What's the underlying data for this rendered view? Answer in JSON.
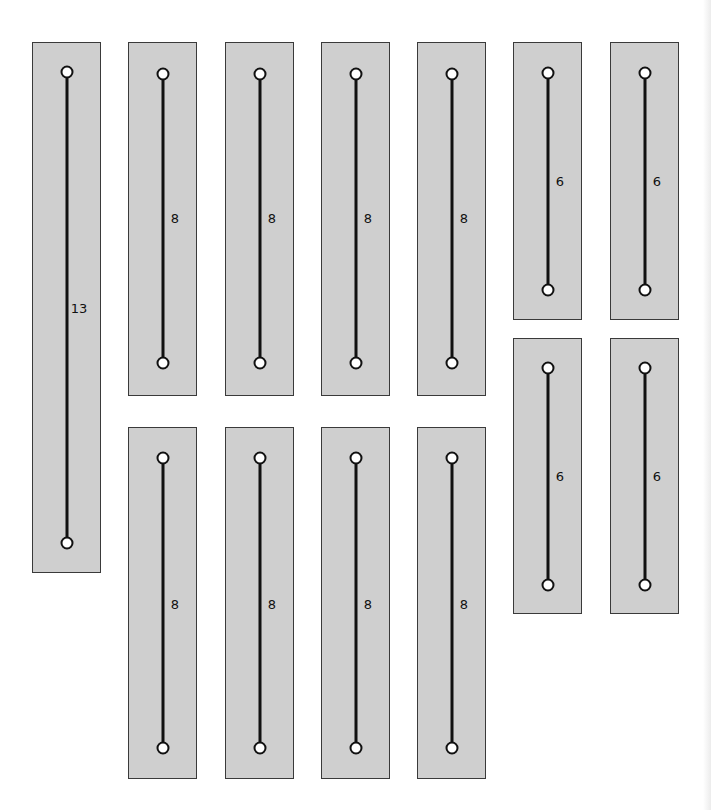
{
  "diagram": {
    "colors": {
      "panel_fill": "#cfcfcf",
      "panel_border": "#3a3a3a",
      "line": "#111111",
      "node_fill": "#ffffff"
    },
    "panels": [
      {
        "id": "p1",
        "length_label": "13",
        "box": [
          32,
          42,
          69,
          531
        ],
        "top_node_y": 72,
        "bottom_node_y": 543,
        "label_y": 308
      },
      {
        "id": "p2",
        "length_label": "8",
        "box": [
          128,
          42,
          69,
          354
        ],
        "top_node_y": 74,
        "bottom_node_y": 363,
        "label_y": 218
      },
      {
        "id": "p3",
        "length_label": "8",
        "box": [
          225,
          42,
          69,
          354
        ],
        "top_node_y": 74,
        "bottom_node_y": 363,
        "label_y": 218
      },
      {
        "id": "p4",
        "length_label": "8",
        "box": [
          321,
          42,
          69,
          354
        ],
        "top_node_y": 74,
        "bottom_node_y": 363,
        "label_y": 218
      },
      {
        "id": "p5",
        "length_label": "8",
        "box": [
          417,
          42,
          69,
          354
        ],
        "top_node_y": 74,
        "bottom_node_y": 363,
        "label_y": 218
      },
      {
        "id": "p6",
        "length_label": "6",
        "box": [
          513,
          42,
          69,
          278
        ],
        "top_node_y": 73,
        "bottom_node_y": 290,
        "label_y": 181
      },
      {
        "id": "p7",
        "length_label": "6",
        "box": [
          610,
          42,
          69,
          278
        ],
        "top_node_y": 73,
        "bottom_node_y": 290,
        "label_y": 181
      },
      {
        "id": "p8",
        "length_label": "8",
        "box": [
          128,
          427,
          69,
          352
        ],
        "top_node_y": 458,
        "bottom_node_y": 748,
        "label_y": 604
      },
      {
        "id": "p9",
        "length_label": "8",
        "box": [
          225,
          427,
          69,
          352
        ],
        "top_node_y": 458,
        "bottom_node_y": 748,
        "label_y": 604
      },
      {
        "id": "p10",
        "length_label": "8",
        "box": [
          321,
          427,
          69,
          352
        ],
        "top_node_y": 458,
        "bottom_node_y": 748,
        "label_y": 604
      },
      {
        "id": "p11",
        "length_label": "8",
        "box": [
          417,
          427,
          69,
          352
        ],
        "top_node_y": 458,
        "bottom_node_y": 748,
        "label_y": 604
      },
      {
        "id": "p12",
        "length_label": "6",
        "box": [
          513,
          338,
          69,
          276
        ],
        "top_node_y": 368,
        "bottom_node_y": 585,
        "label_y": 476
      },
      {
        "id": "p13",
        "length_label": "6",
        "box": [
          610,
          338,
          69,
          276
        ],
        "top_node_y": 368,
        "bottom_node_y": 585,
        "label_y": 476
      }
    ]
  }
}
